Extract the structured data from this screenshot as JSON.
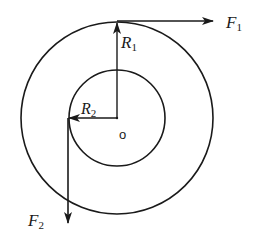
{
  "diagram": {
    "center": {
      "x": 117,
      "y": 118,
      "label": "o"
    },
    "outer_circle": {
      "r": 96
    },
    "inner_circle": {
      "r": 48
    },
    "radii": [
      {
        "name": "R",
        "sub": "1",
        "direction": "up",
        "to": {
          "x": 117,
          "y": 22
        }
      },
      {
        "name": "R",
        "sub": "2",
        "direction": "left",
        "to": {
          "x": 69,
          "y": 118
        }
      }
    ],
    "forces": [
      {
        "name": "F",
        "sub": "1",
        "from": {
          "x": 117,
          "y": 21
        },
        "to": {
          "x": 212,
          "y": 21
        },
        "direction": "right"
      },
      {
        "name": "F",
        "sub": "2",
        "from": {
          "x": 68,
          "y": 118
        },
        "to": {
          "x": 68,
          "y": 222
        },
        "direction": "down"
      }
    ],
    "stroke_color": "#1a1a1a"
  },
  "labels": {
    "F1": "F",
    "F1_sub": "1",
    "F2": "F",
    "F2_sub": "2",
    "R1": "R",
    "R1_sub": "1",
    "R2": "R",
    "R2_sub": "2",
    "origin": "o"
  }
}
